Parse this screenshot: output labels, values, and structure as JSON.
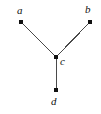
{
  "figure": {
    "kind": "graph-diagram",
    "width": 101,
    "height": 114,
    "background_color": "#ffffff",
    "edge_color": "#4a4a4a",
    "vertex_color": "#111111",
    "label_color": "#101010"
  },
  "chart_data": {
    "type": "scatter",
    "title": "",
    "xlabel": "",
    "ylabel": "",
    "grid": false,
    "legend": null,
    "xlim": [
      0,
      101
    ],
    "ylim": [
      0,
      114
    ],
    "nodes": [
      {
        "id": "a",
        "label": "a",
        "x": 21,
        "y": 22,
        "label_x": 17,
        "label_y": 5
      },
      {
        "id": "b",
        "label": "b",
        "x": 90,
        "y": 22,
        "label_x": 85,
        "label_y": 4
      },
      {
        "id": "c",
        "label": "c",
        "x": 56,
        "y": 57,
        "label_x": 60,
        "label_y": 56
      },
      {
        "id": "d",
        "label": "d",
        "x": 56,
        "y": 90,
        "label_x": 51,
        "label_y": 96
      }
    ],
    "edges": [
      {
        "from": "a",
        "to": "c",
        "x1": 21,
        "y1": 22,
        "x2": 56,
        "y2": 57
      },
      {
        "from": "b",
        "to": "c",
        "x1": 90,
        "y1": 22,
        "x2": 56,
        "y2": 57
      },
      {
        "from": "c",
        "to": "d",
        "x1": 56,
        "y1": 57,
        "x2": 56,
        "y2": 90
      }
    ]
  }
}
